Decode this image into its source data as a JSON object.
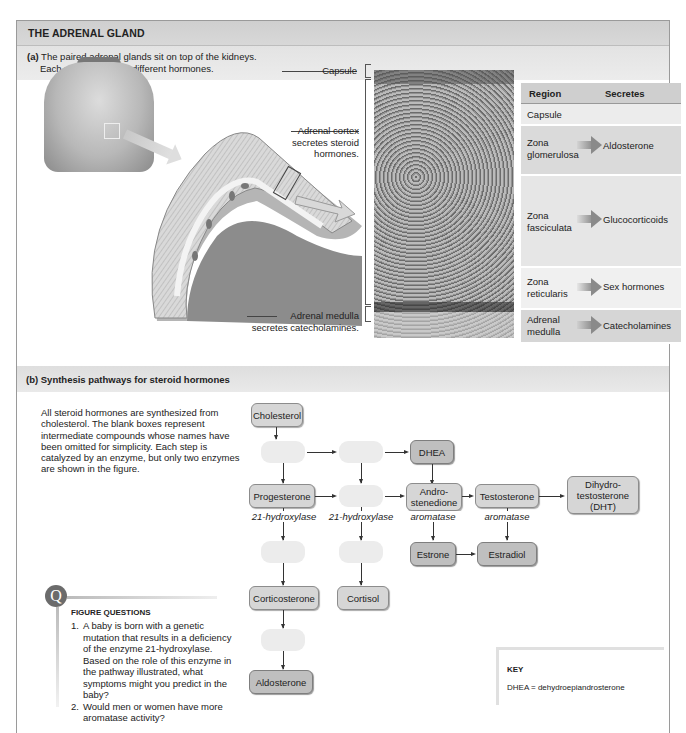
{
  "figure": {
    "title": "THE ADRENAL GLAND"
  },
  "section_a": {
    "label": "(a)",
    "caption_line1": "The paired adrenal glands sit on top of the kidneys.",
    "caption_line2": "Each region secretes different hormones.",
    "labels": {
      "capsule": "Capsule",
      "cortex_line1": "Adrenal cortex",
      "cortex_line2": "secretes steroid",
      "cortex_line3": "hormones.",
      "medulla_line1": "Adrenal medulla",
      "medulla_line2": "secretes catecholamines."
    },
    "table": {
      "headers": [
        "Region",
        "Secretes"
      ],
      "rows": [
        {
          "region_line1": "Capsule",
          "region_line2": "",
          "secretes": ""
        },
        {
          "region_line1": "Zona",
          "region_line2": "glomerulosa",
          "secretes": "Aldosterone"
        },
        {
          "region_line1": "Zona",
          "region_line2": "fasciculata",
          "secretes": "Glucocorticoids"
        },
        {
          "region_line1": "Zona",
          "region_line2": "reticularis",
          "secretes": "Sex hormones"
        },
        {
          "region_line1": "Adrenal",
          "region_line2": "medulla",
          "secretes": "Catecholamines"
        }
      ]
    },
    "icons": [
      "torso-illustration",
      "adrenal-gland-cross-section",
      "micrograph-image",
      "arrow-icon"
    ]
  },
  "section_b": {
    "title": "(b) Synthesis pathways for steroid hormones",
    "intro": "All steroid hormones are synthesized from cholesterol. The blank boxes represent intermediate compounds whose names have been omitted for simplicity. Each step is catalyzed by an enzyme, but only two enzymes are shown in the figure.",
    "nodes": {
      "cholesterol": "Cholesterol",
      "dhea": "DHEA",
      "progesterone": "Progesterone",
      "androstenedione_line1": "Andro-",
      "androstenedione_line2": "stenedione",
      "testosterone": "Testosterone",
      "dht_line1": "Dihydro-",
      "dht_line2": "testosterone",
      "dht_line3": "(DHT)",
      "estrone": "Estrone",
      "estradiol": "Estradiol",
      "corticosterone": "Corticosterone",
      "cortisol": "Cortisol",
      "aldosterone": "Aldosterone"
    },
    "enzymes": {
      "e1": "21-hydroxylase",
      "e2": "21-hydroxylase",
      "e3": "aromatase",
      "e4": "aromatase"
    },
    "questions": {
      "icon": "Q",
      "title": "FIGURE QUESTIONS",
      "items": [
        {
          "num": "1.",
          "text": "A baby is born with a genetic mutation that results in a deficiency of the enzyme 21-hydroxylase. Based on the role of this enzyme in the pathway illustrated, what symptoms might you predict in the baby?"
        },
        {
          "num": "2.",
          "text": "Would men or women have more aromatase activity?"
        }
      ]
    },
    "key": {
      "title": "KEY",
      "definition": "DHEA = dehydroepiandrosterone"
    }
  }
}
